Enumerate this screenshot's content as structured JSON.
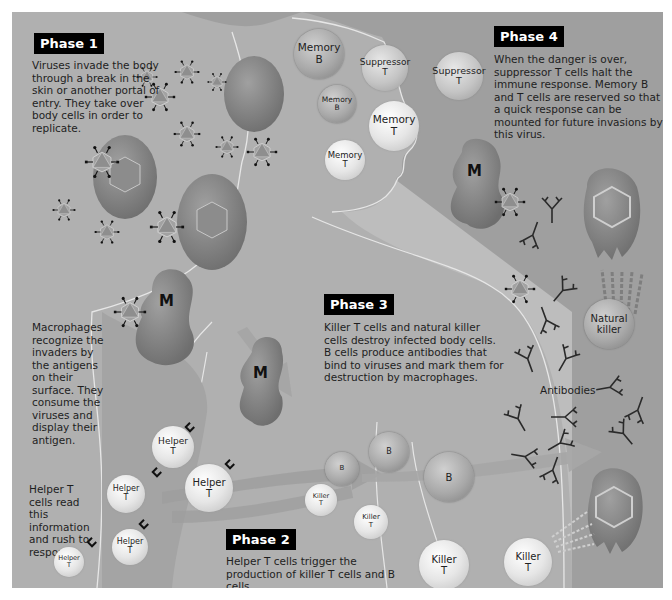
{
  "phases": {
    "phase1": {
      "title": "Phase 1",
      "text": "Viruses invade the body through a break in the skin or another portal of entry. They take over body cells in order to replicate."
    },
    "phase2": {
      "title": "Phase 2",
      "text": "Helper T cells trigger the production of killer T cells and B cells."
    },
    "phase3": {
      "title": "Phase 3",
      "text": "Killer T cells and natural killer cells destroy infected body cells. B cells produce antibodies that bind to viruses and mark them for destruction by macrophages."
    },
    "phase4": {
      "title": "Phase 4",
      "text": "When the danger is over, suppressor T cells halt the immune response. Memory B and T cells are reserved so that a quick response can be mounted for future invasions by this virus."
    }
  },
  "captions": {
    "macrophages": "Macrophages recognize the invaders by the antigens on their surface. They consume the viruses and display their antigen.",
    "helper": "Helper T cells read this information and rush to respond.",
    "antibodies": "Antibodies"
  },
  "cells": {
    "memory_b_1": [
      "Memory",
      "B"
    ],
    "memory_b_2": [
      "Memory",
      "B"
    ],
    "suppressor_1": [
      "Suppressor",
      "T"
    ],
    "suppressor_2": [
      "Suppressor",
      "T"
    ],
    "memory_t_1": [
      "Memory",
      "T"
    ],
    "memory_t_2": [
      "Memory",
      "T"
    ],
    "natural_killer": [
      "Natural",
      "killer"
    ],
    "helper_1": [
      "Helper",
      "T"
    ],
    "helper_2": [
      "Helper",
      "T"
    ],
    "helper_3": [
      "Helper",
      "T"
    ],
    "helper_4": [
      "Helper",
      "T"
    ],
    "helper_5": [
      "Helper",
      "T"
    ],
    "b_1": "B",
    "b_2": "B",
    "b_3": "B",
    "killer_1": [
      "Killer",
      "T"
    ],
    "killer_2": [
      "Killer",
      "T"
    ],
    "killer_3": [
      "Killer",
      "T"
    ],
    "killer_4": [
      "Killer",
      "T"
    ],
    "macrophage": "M"
  },
  "colors": {
    "background": "#bdbdbd",
    "body": "#a9a9a9",
    "head_bg": "#9d9d9d",
    "cell_red": "#8a8a8a",
    "phase_label_bg": "#000000"
  }
}
